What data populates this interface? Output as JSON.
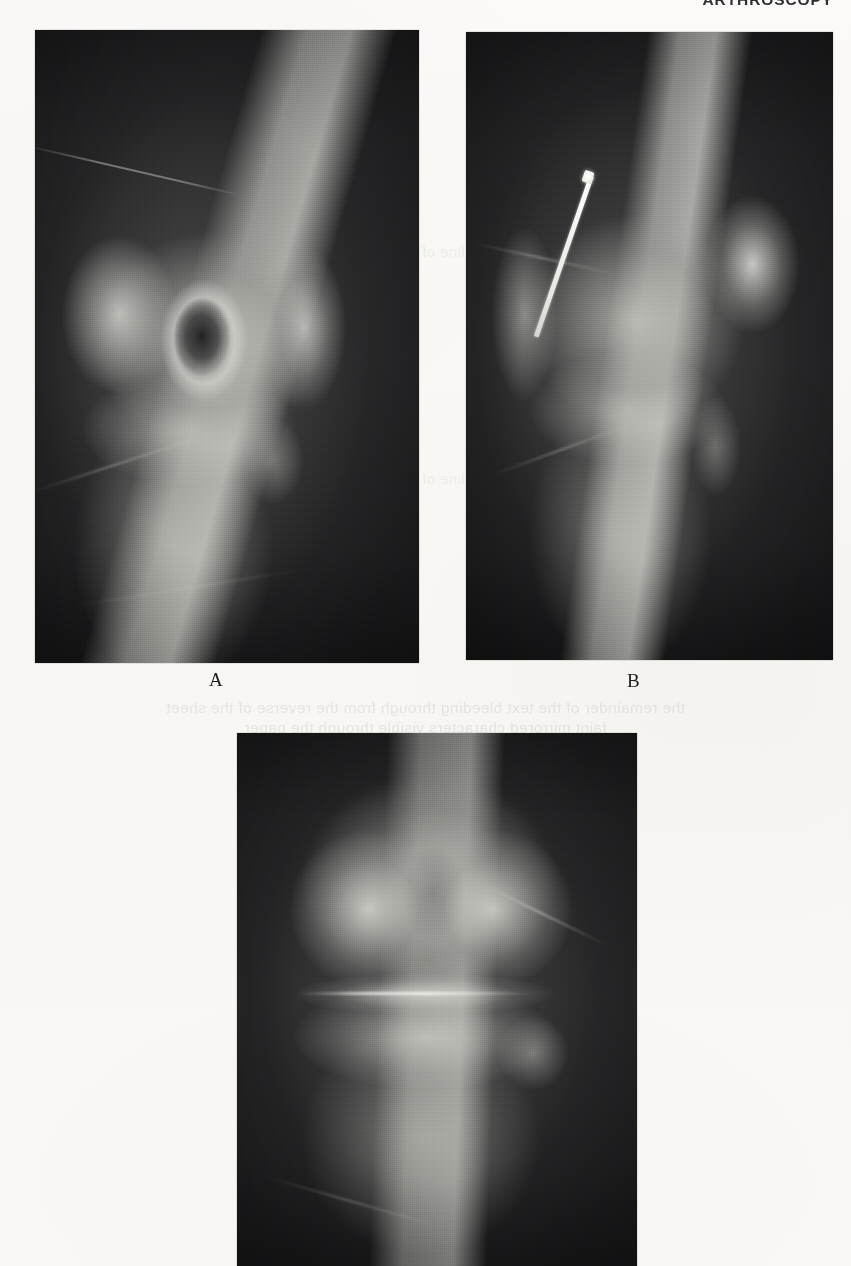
{
  "page": {
    "background_color": "#f8f7f4",
    "kind": "textbook-figure-page",
    "width": 851,
    "height": 1266
  },
  "running_header": {
    "text": "ARTHROSCOPY",
    "note": "clipped at top page edge; only lower stroke tips of the glyphs are rendered"
  },
  "bleed_through": {
    "line1": "the remainder of the text bleeding through from the reverse of the sheet",
    "line2": "faint mirrored characters visible through the paper",
    "line3": "ghosted line of reversed text",
    "line4": "ghosted line of reversed text"
  },
  "figure": {
    "panels": [
      {
        "id": "A",
        "label": "A",
        "view": "lateral knee radiograph",
        "modality": "plain radiograph",
        "finding": "lucent osteochondral defect with sclerotic rim in the femoral condyle",
        "hardware": "none"
      },
      {
        "id": "B",
        "label": "B",
        "view": "lateral knee radiograph",
        "modality": "plain radiograph",
        "finding": "osteochondral fragment fixed in place",
        "hardware": "metallic fixation pin / K-wire directed obliquely into the femoral condyle"
      },
      {
        "id": "C",
        "label": "",
        "view": "anteroposterior (AP) knee radiograph",
        "modality": "plain radiograph",
        "finding": "femoral condyles, intercondylar notch, joint line and proximal tibia",
        "hardware": "none",
        "note": "panel is cropped by the bottom edge of the page; its letter label is not visible"
      }
    ]
  }
}
